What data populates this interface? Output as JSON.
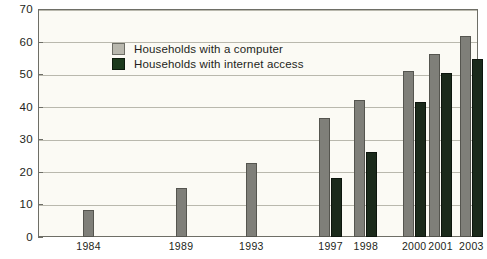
{
  "chart_data": {
    "type": "bar",
    "title": "",
    "xlabel": "",
    "ylabel": "",
    "ylim": [
      0,
      70
    ],
    "ytick_step": 10,
    "yticks": [
      0,
      10,
      20,
      30,
      40,
      50,
      60,
      70
    ],
    "ytick_labels": [
      "0",
      "10",
      "20",
      "30",
      "40",
      "50",
      "60",
      "70"
    ],
    "grid": true,
    "legend_position": "upper-left-inside",
    "categories": [
      "1984",
      "1989",
      "1993",
      "1997",
      "1998",
      "2000",
      "2001",
      "2003"
    ],
    "series": [
      {
        "name": "Households with a computer",
        "color": "#7f7f79",
        "values": [
          8.2,
          15.0,
          22.8,
          36.6,
          42.1,
          51.0,
          56.3,
          61.8
        ]
      },
      {
        "name": "Households with internet access",
        "color": "#1b2a1b",
        "values": [
          null,
          null,
          null,
          18.0,
          26.2,
          41.5,
          50.4,
          54.7
        ]
      }
    ],
    "category_positions": [
      0.115,
      0.325,
      0.485,
      0.665,
      0.745,
      0.855,
      0.915,
      0.985
    ]
  },
  "legend": {
    "items": [
      {
        "label": "Households with a computer",
        "swatch": "computer"
      },
      {
        "label": "Households with internet access",
        "swatch": "internet"
      }
    ]
  },
  "colors": {
    "computer_bar": "#7f7f79",
    "internet_bar": "#1b2a1b",
    "plot_background": "#fbfaf4",
    "axis": "#6e6e66",
    "gridline": "#b9b8ad",
    "text": "#231f20"
  }
}
